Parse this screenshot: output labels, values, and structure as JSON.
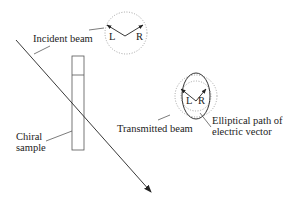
{
  "diagram": {
    "labels": {
      "incident_beam": "Incident beam",
      "chiral_sample_line1": "Chiral",
      "chiral_sample_line2": "sample",
      "transmitted_beam": "Transmitted beam",
      "elliptical_line1": "Elliptical path of",
      "elliptical_line2": "electric vector",
      "incident_left": "L",
      "incident_right": "R",
      "transmitted_left": "L",
      "transmitted_right": "R"
    },
    "colors": {
      "line": "#222222",
      "dotted": "#999999"
    }
  }
}
